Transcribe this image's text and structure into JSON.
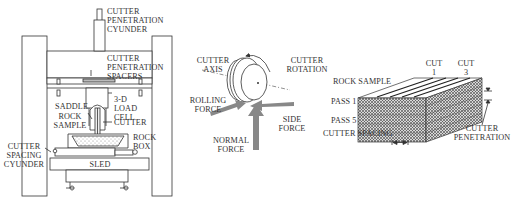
{
  "panels": {
    "rig": {
      "labels": {
        "cutter_penetration_cylinder": [
          "CUTTER",
          "PENETRATION",
          "CYUNDER"
        ],
        "cutter_penetration_spacers": [
          "CUTTER",
          "PENETRATION",
          "SPACERS"
        ],
        "load_cell": [
          "3-D",
          "LOAD",
          "CELL"
        ],
        "saddle": "SADDLE",
        "rock_sample": [
          "ROCK",
          "SAMPLE"
        ],
        "cutter": "CUTTER",
        "rock_box": [
          "ROCK",
          "BOX"
        ],
        "cutter_spacing_cylinder": [
          "CUTTER",
          "SPACING",
          "CYUNDER"
        ],
        "sled": "SLED"
      }
    },
    "cutter_forces": {
      "labels": {
        "cutter_axis": [
          "CUTTER",
          "AXIS"
        ],
        "cutter_rotation": [
          "CUTTER",
          "ROTATION"
        ],
        "rolling_force": [
          "ROLLING",
          "FORCE"
        ],
        "side_force": [
          "SIDE",
          "FORCE"
        ],
        "normal_force": [
          "NORMAL",
          "FORCE"
        ]
      }
    },
    "rock_block": {
      "labels": {
        "rock_sample": "ROCK SAMPLE",
        "cut_1": [
          "CUT",
          "1"
        ],
        "cut_3": [
          "CUT",
          "3"
        ],
        "pass_1": "PASS 1",
        "pass_5": "PASS 5",
        "cutter_spacing": "CUTTER SPACING",
        "cutter_penetration": [
          "CUTTER",
          "PENETRATION"
        ]
      }
    }
  }
}
